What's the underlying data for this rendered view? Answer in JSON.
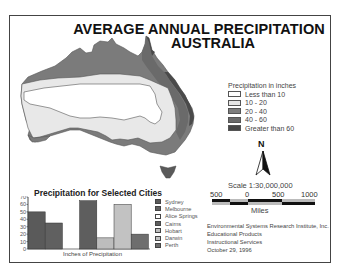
{
  "title": {
    "line1": "AVERAGE ANNUAL PRECIPITATION",
    "line2": "AUSTRALIA"
  },
  "legend": {
    "title": "Precipitation in inches",
    "items": [
      {
        "label": "Less than 10",
        "color": "#ffffff"
      },
      {
        "label": "10 - 20",
        "color": "#e6e6e6"
      },
      {
        "label": "20 - 40",
        "color": "#7d7d7d"
      },
      {
        "label": "40 - 60",
        "color": "#6a6a6a"
      },
      {
        "label": "Greater than 60",
        "color": "#474747"
      }
    ]
  },
  "north_arrow": {
    "label": "N"
  },
  "scale": {
    "title": "Scale 1:30,000,000",
    "ticks": [
      "500",
      "0",
      "500",
      "1000"
    ],
    "unit": "Miles"
  },
  "credits": {
    "line1": "Environmental Systems Research Institute, Inc.",
    "line2": "Educational Products",
    "line3": "Instructional Services",
    "line4": "October 29, 1996"
  },
  "chart": {
    "title": "Precipitation for Selected Cities",
    "xlabel": "Inches of Precipitation",
    "y_ticks": [
      "70",
      "60",
      "50",
      "40",
      "30",
      "20",
      "10",
      "0"
    ],
    "legend": [
      {
        "label": "Sydney",
        "color": "#5a5a5a"
      },
      {
        "label": "Melbourne",
        "color": "#606060"
      },
      {
        "label": "Alice Springs",
        "color": "#ffffff"
      },
      {
        "label": "Cairns",
        "color": "#5e5e5e"
      },
      {
        "label": "Hobart",
        "color": "#bdbdbd"
      },
      {
        "label": "Darwin",
        "color": "#c2c2c2"
      },
      {
        "label": "Perth",
        "color": "#6e6e6e"
      }
    ]
  },
  "chart_data": {
    "type": "bar",
    "title": "Precipitation for Selected Cities",
    "xlabel": "Inches of Precipitation",
    "ylabel": "",
    "categories": [
      "Sydney",
      "Melbourne",
      "Alice Springs",
      "Cairns",
      "Hobart",
      "Darwin",
      "Perth"
    ],
    "values": [
      50,
      35,
      0,
      65,
      15,
      60,
      20
    ],
    "ylim": [
      0,
      70
    ],
    "y_ticks": [
      0,
      10,
      20,
      30,
      40,
      50,
      60,
      70
    ],
    "grid": false,
    "legend_position": "right"
  }
}
